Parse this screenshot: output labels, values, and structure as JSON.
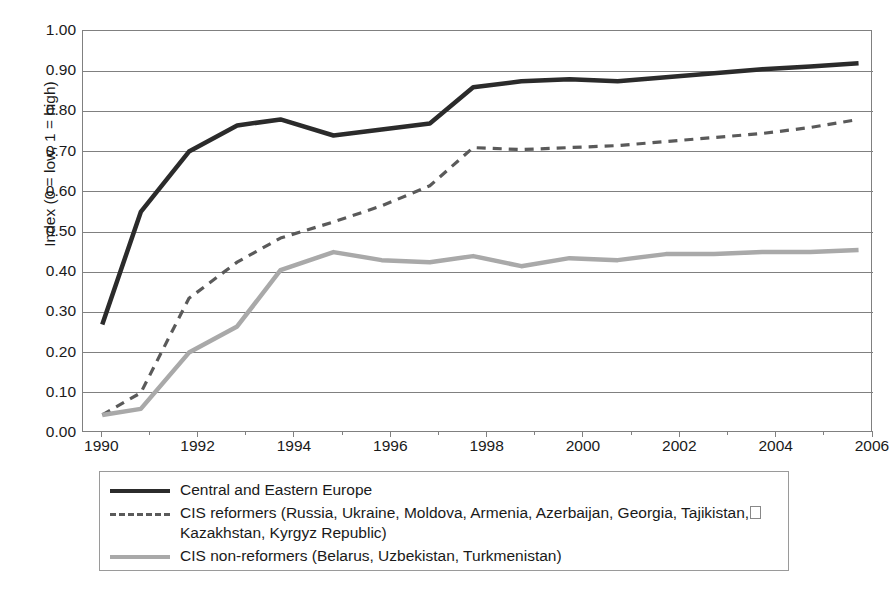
{
  "chart_data": {
    "type": "line",
    "title": "",
    "subtitle": "",
    "xlabel": "",
    "ylabel": "Index (0 = low, 1 = high)",
    "xlim": [
      1989.6,
      2006.0
    ],
    "ylim": [
      0.0,
      1.0
    ],
    "grid": "horizontal",
    "legend_position": "below-plot",
    "x_tick_labels": [
      "1990",
      "1992",
      "1994",
      "1996",
      "1998",
      "2000",
      "2002",
      "2004",
      "2006"
    ],
    "x_tick_values": [
      1990,
      1992,
      1994,
      1996,
      1998,
      2000,
      2002,
      2004,
      2006
    ],
    "x_minor_tick_values": [
      1991,
      1993,
      1995,
      1997,
      1999,
      2001,
      2003,
      2005
    ],
    "y_tick_labels": [
      "0.00",
      "0.10",
      "0.20",
      "0.30",
      "0.40",
      "0.50",
      "0.60",
      "0.70",
      "0.80",
      "0.90",
      "1.00"
    ],
    "y_tick_values": [
      0.0,
      0.1,
      0.2,
      0.3,
      0.4,
      0.5,
      0.6,
      0.7,
      0.8,
      0.9,
      1.0
    ],
    "x": [
      1990.0,
      1990.8,
      1991.8,
      1992.8,
      1993.7,
      1994.8,
      1995.8,
      1996.8,
      1997.7,
      1998.7,
      1999.7,
      2000.7,
      2001.7,
      2002.7,
      2003.7,
      2004.7,
      2005.7
    ],
    "series": [
      {
        "name": "Central and Eastern Europe",
        "style": "solid",
        "color": "#2b2b2b",
        "width": 4.5,
        "values": [
          0.27,
          0.55,
          0.7,
          0.765,
          0.78,
          0.74,
          0.755,
          0.77,
          0.86,
          0.875,
          0.88,
          0.875,
          0.885,
          0.895,
          0.905,
          0.912,
          0.92
        ]
      },
      {
        "name": "CIS reformers",
        "style": "dashed",
        "color": "#5a5a5a",
        "width": 3.2,
        "values": [
          0.045,
          0.1,
          0.335,
          0.425,
          0.485,
          0.525,
          0.565,
          0.615,
          0.71,
          0.705,
          0.71,
          0.715,
          0.725,
          0.735,
          0.745,
          0.76,
          0.78
        ]
      },
      {
        "name": "CIS non-reformers",
        "style": "solid",
        "color": "#a9a9a9",
        "width": 4.5,
        "values": [
          0.045,
          0.06,
          0.2,
          0.265,
          0.405,
          0.45,
          0.43,
          0.425,
          0.44,
          0.415,
          0.435,
          0.43,
          0.445,
          0.445,
          0.45,
          0.45,
          0.455
        ]
      }
    ]
  },
  "axes": {
    "y_title": "Index (0 = low, 1 = high)"
  },
  "legend": {
    "items": [
      {
        "swatch": "solid-dark",
        "label": "Central and Eastern Europe"
      },
      {
        "swatch": "dashed",
        "label_line1": "CIS reformers (Russia, Ukraine, Moldova, Armenia, Azerbaijan, Georgia, Tajikistan,",
        "label_line2": "Kazakhstan, Kyrgyz Republic)"
      },
      {
        "swatch": "solid-gray",
        "label": "CIS non-reformers (Belarus, Uzbekistan, Turkmenistan)"
      }
    ]
  },
  "colors": {
    "series_dark": "#2b2b2b",
    "series_dashed": "#5a5a5a",
    "series_gray": "#a9a9a9",
    "gridline": "#808080",
    "frame": "#808080",
    "text": "#1a1a1a"
  }
}
